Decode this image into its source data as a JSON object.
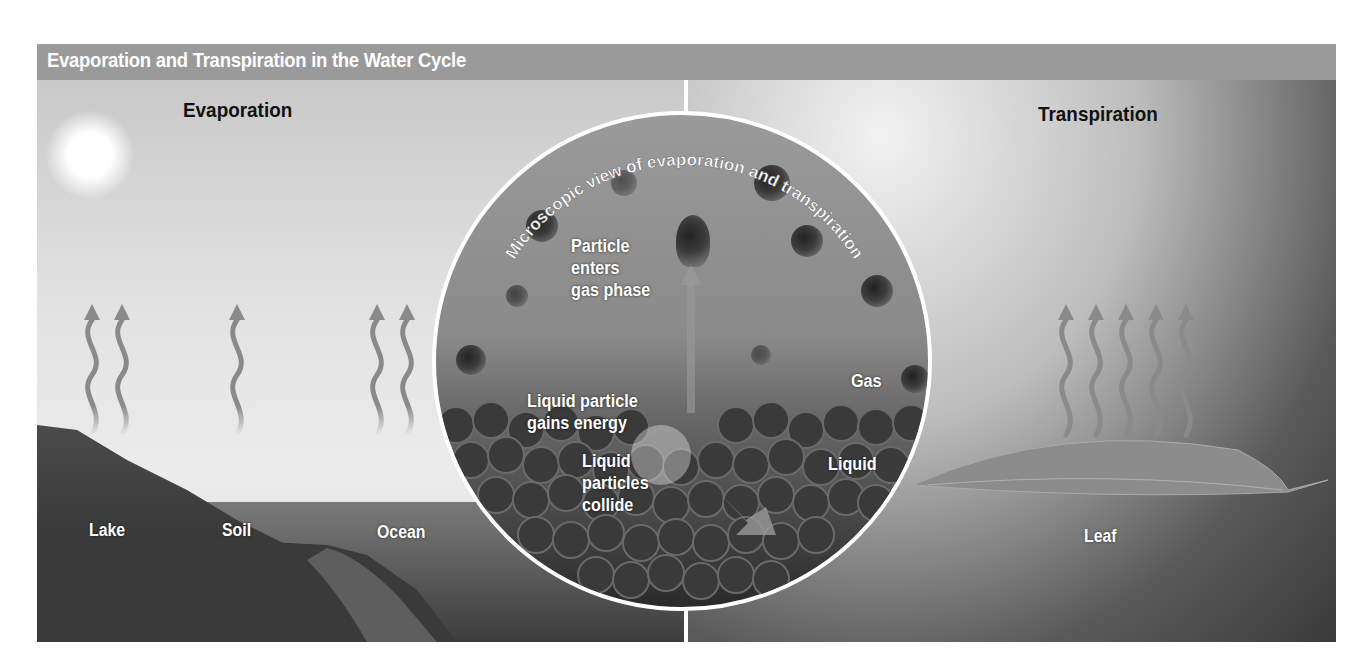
{
  "title": "Evaporation and Transpiration in the Water Cycle",
  "sections": {
    "evaporation": {
      "heading": "Evaporation",
      "labels": {
        "lake": "Lake",
        "soil": "Soil",
        "ocean": "Ocean"
      }
    },
    "transpiration": {
      "heading": "Transpiration",
      "labels": {
        "leaf": "Leaf"
      }
    }
  },
  "microscopic_view": {
    "title": "Microscopic view of evaporation and transpiration",
    "labels": {
      "particle_enters": [
        "Particle",
        "enters",
        "gas phase"
      ],
      "gains_energy": [
        "Liquid particle",
        "gains energy"
      ],
      "collide": [
        "Liquid",
        "particles",
        "collide"
      ],
      "gas": "Gas",
      "liquid": "Liquid"
    }
  },
  "colors": {
    "title_bar": "#9a9a9a",
    "title_text": "#ffffff",
    "heading_text": "#111111",
    "arrow": "#8a8a8a",
    "circle_border": "#ffffff"
  }
}
